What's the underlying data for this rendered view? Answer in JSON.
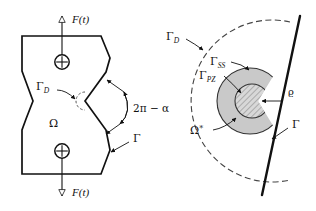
{
  "figure": {
    "background_color": "#ffffff",
    "line_color": "#111111",
    "shaded_region_color": "#c9c9c9",
    "hatched_region_color": "#d6d6d6"
  },
  "left_diagram": {
    "name": "notched-specimen",
    "description": "Hourglass shaped specimen loaded by F(t) at top and bottom with a V-notch on the right edge",
    "labels": {
      "force_top": "F(t)",
      "force_bottom": "F(t)",
      "domain": "Ω",
      "gamma_d": "Γ",
      "gamma_d_sub": "D",
      "gamma_outer": "Γ",
      "notch_angle": "2π − α"
    },
    "annotations": [
      {
        "label": "Γ_D",
        "points_to": "dashed semicircle at notch tip"
      },
      {
        "label": "2π − α",
        "points_to": "notch opening angle arc"
      },
      {
        "label": "Γ",
        "points_to": "outer boundary of specimen"
      },
      {
        "label": "Ω",
        "points_to": "interior domain of specimen"
      }
    ]
  },
  "right_diagram": {
    "name": "crack-tip-zones",
    "description": "Crack-tip region showing outer dashed boundary, small scale yielding annulus and process zone disc around a straight crack",
    "labels": {
      "gamma_d": "Γ",
      "gamma_d_sub": "D",
      "gamma_ss": "Γ",
      "gamma_ss_sub": "SS",
      "gamma_pz": "Γ",
      "gamma_pz_sub": "PZ",
      "omega_star": "Ω",
      "omega_star_sup": "*",
      "rho": "ϱ",
      "gamma_outer": "Γ"
    },
    "annotations": [
      {
        "label": "Γ_D",
        "points_to": "outer dashed arc boundary"
      },
      {
        "label": "Γ_SS",
        "points_to": "outer edge of shaded small-scale-yielding annulus"
      },
      {
        "label": "Γ_PZ",
        "points_to": "edge of hatched process zone disc"
      },
      {
        "label": "Ω*",
        "points_to": "shaded annular sub-domain"
      },
      {
        "label": "ϱ",
        "points_to": "process zone radius at crack tip"
      },
      {
        "label": "Γ",
        "points_to": "straight crack line boundary"
      }
    ]
  }
}
